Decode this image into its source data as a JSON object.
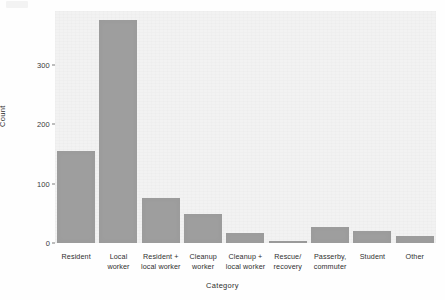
{
  "chart_data": {
    "type": "bar",
    "title": "",
    "xlabel": "Category",
    "ylabel": "Count",
    "categories": [
      "Resident",
      "Local\nworker",
      "Resident +\nlocal worker",
      "Cleanup\nworker",
      "Cleanup +\nlocal worker",
      "Rescue/\nrecovery",
      "Passerby,\ncommuter",
      "Student",
      "Other"
    ],
    "values": [
      154,
      375,
      75,
      48,
      17,
      3,
      27,
      21,
      11
    ],
    "ylim": [
      0,
      390
    ],
    "yticks": [
      "0",
      "100",
      "200",
      "300"
    ],
    "ytick_values": [
      0,
      100,
      200,
      300
    ],
    "grid": false,
    "legend": "none",
    "bar_color": "#9e9e9e",
    "panel_color": "#f2f2f2"
  }
}
